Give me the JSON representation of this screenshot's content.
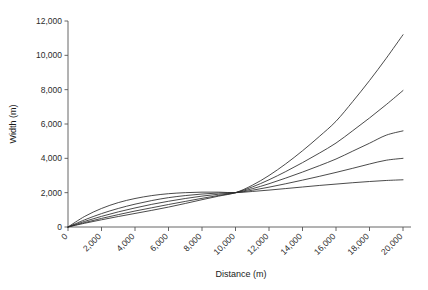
{
  "chart_data": {
    "type": "line",
    "title": "",
    "xlabel": "Distance (m)",
    "ylabel": "Width (m)",
    "xlim": [
      0,
      20000
    ],
    "ylim": [
      0,
      12000
    ],
    "grid": false,
    "legend": "none",
    "x_ticks": [
      0,
      2000,
      4000,
      6000,
      8000,
      10000,
      12000,
      14000,
      16000,
      18000,
      20000
    ],
    "x_tick_labels": [
      "0",
      "2,000",
      "4,000",
      "6,000",
      "8,000",
      "10,000",
      "12,000",
      "14,000",
      "16,000",
      "18,000",
      "20,000"
    ],
    "y_ticks": [
      0,
      2000,
      4000,
      6000,
      8000,
      10000,
      12000
    ],
    "y_tick_labels": [
      "0",
      "2,000",
      "4,000",
      "6,000",
      "8,000",
      "10,000",
      "12,000"
    ],
    "x_tick_label_rotation": -45,
    "line_color": "#2a2a2a",
    "background_color": "#ffffff",
    "annotation": "All five curves originate at (0, 0), converge near (10,000, 2,000), then fan out with increasing spread.",
    "convergence_point": {
      "x": 10000,
      "y": 2000
    },
    "x": [
      0,
      1000,
      2000,
      3000,
      4000,
      5000,
      6000,
      7000,
      8000,
      9000,
      10000,
      11000,
      12000,
      13000,
      14000,
      15000,
      16000,
      17000,
      18000,
      19000,
      20000
    ],
    "series": [
      {
        "name": "curve-1",
        "end_value": 11200,
        "values": [
          0,
          220,
          420,
          610,
          790,
          970,
          1160,
          1370,
          1590,
          1800,
          2000,
          2430,
          3000,
          3680,
          4440,
          5270,
          6160,
          7310,
          8530,
          9830,
          11200
        ]
      },
      {
        "name": "curve-2",
        "end_value": 7950,
        "values": [
          0,
          260,
          500,
          720,
          930,
          1120,
          1310,
          1490,
          1670,
          1840,
          2000,
          2330,
          2750,
          3230,
          3750,
          4300,
          4890,
          5610,
          6350,
          7130,
          7950
        ]
      },
      {
        "name": "curve-3",
        "end_value": 5600,
        "values": [
          0,
          330,
          620,
          880,
          1110,
          1320,
          1500,
          1660,
          1800,
          1910,
          2000,
          2230,
          2520,
          2850,
          3200,
          3570,
          3960,
          4420,
          4880,
          5350,
          5600
        ]
      },
      {
        "name": "curve-4",
        "end_value": 4000,
        "values": [
          0,
          420,
          780,
          1080,
          1330,
          1540,
          1710,
          1830,
          1920,
          1980,
          2000,
          2140,
          2320,
          2520,
          2730,
          2950,
          3180,
          3420,
          3670,
          3890,
          4000
        ]
      },
      {
        "name": "curve-5",
        "end_value": 2750,
        "values": [
          0,
          620,
          1080,
          1420,
          1660,
          1830,
          1940,
          2000,
          2030,
          2030,
          2000,
          2070,
          2150,
          2240,
          2330,
          2420,
          2500,
          2580,
          2650,
          2710,
          2750
        ]
      }
    ]
  }
}
